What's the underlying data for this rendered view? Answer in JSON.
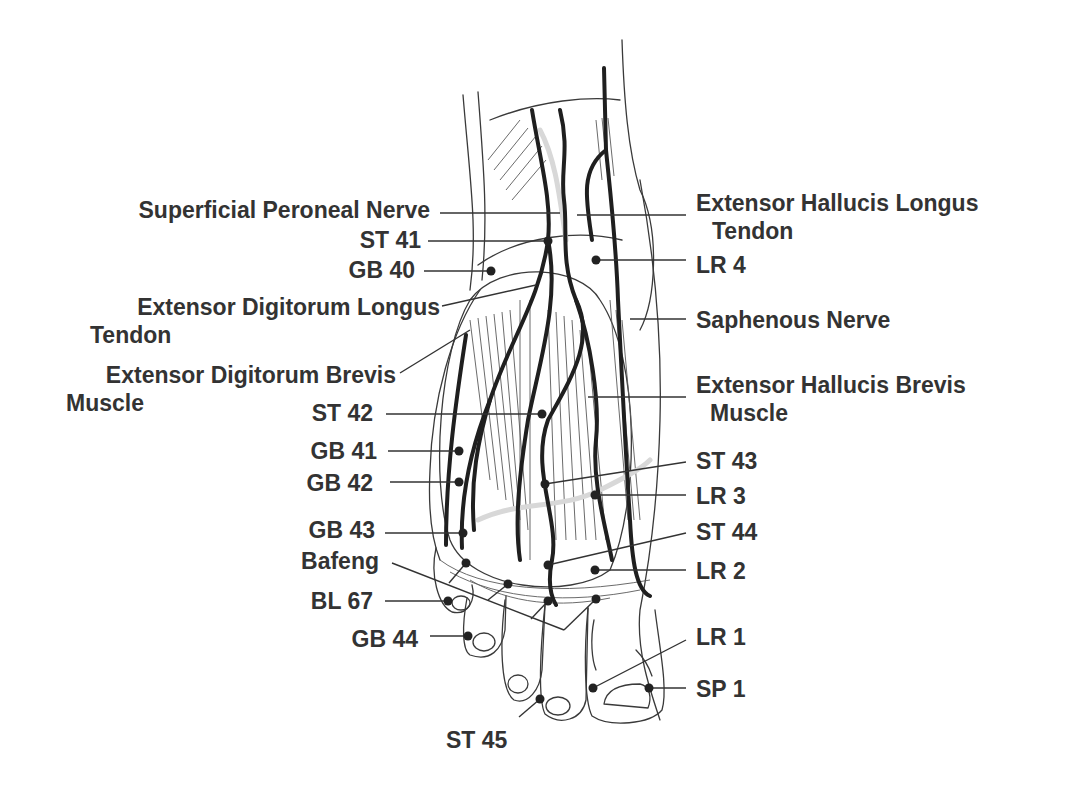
{
  "diagram": {
    "colors": {
      "text": "#333333",
      "line": "#333333",
      "nerve": "#1f1f1f",
      "background": "#ffffff"
    },
    "labels_left": [
      {
        "id": "superficial-peroneal-nerve",
        "lines": [
          "Superficial Peroneal Nerve"
        ],
        "x": 430,
        "y": 218,
        "anchor": "end",
        "leader": [
          440,
          213,
          560,
          213
        ],
        "point": null
      },
      {
        "id": "st-41",
        "lines": [
          "ST 41"
        ],
        "x": 421,
        "y": 248,
        "anchor": "end",
        "leader": [
          428,
          241,
          548,
          241
        ],
        "point": [
          548,
          241
        ]
      },
      {
        "id": "gb-40",
        "lines": [
          "GB 40"
        ],
        "x": 415,
        "y": 278,
        "anchor": "end",
        "leader": [
          424,
          271,
          491,
          271
        ],
        "point": [
          491,
          271
        ]
      },
      {
        "id": "extensor-digitorum-longus-tendon",
        "lines": [
          "Extensor Digitorum Longus",
          "Tendon"
        ],
        "x": 440,
        "y": 315,
        "anchor": "end",
        "line2_x": 90,
        "leader": [
          442,
          306,
          536,
          285
        ],
        "point": null
      },
      {
        "id": "extensor-digitorum-brevis-muscle",
        "lines": [
          "Extensor Digitorum Brevis",
          "Muscle"
        ],
        "x": 396,
        "y": 383,
        "anchor": "end",
        "line2_x": 66,
        "leader": [
          400,
          373,
          470,
          330
        ],
        "point": null
      },
      {
        "id": "st-42",
        "lines": [
          "ST 42"
        ],
        "x": 373,
        "y": 421,
        "anchor": "end",
        "leader": [
          386,
          414,
          542,
          414
        ],
        "point": [
          542,
          414
        ]
      },
      {
        "id": "gb-41",
        "lines": [
          "GB 41"
        ],
        "x": 377,
        "y": 459,
        "anchor": "end",
        "leader": [
          388,
          451,
          459,
          451
        ],
        "point": [
          459,
          451
        ]
      },
      {
        "id": "gb-42",
        "lines": [
          "GB 42"
        ],
        "x": 373,
        "y": 491,
        "anchor": "end",
        "leader": [
          390,
          482,
          459,
          482
        ],
        "point": [
          459,
          482
        ]
      },
      {
        "id": "gb-43",
        "lines": [
          "GB 43"
        ],
        "x": 375,
        "y": 538,
        "anchor": "end",
        "leader": [
          385,
          533,
          463,
          533
        ],
        "point": [
          463,
          533
        ]
      },
      {
        "id": "bafeng",
        "lines": [
          "Bafeng"
        ],
        "x": 379,
        "y": 569,
        "anchor": "end",
        "leader": [
          392,
          563,
          564,
          630
        ],
        "point": null
      },
      {
        "id": "bl-67",
        "lines": [
          "BL 67"
        ],
        "x": 373,
        "y": 609,
        "anchor": "end",
        "leader": [
          385,
          601,
          448,
          601
        ],
        "point": [
          448,
          601
        ]
      },
      {
        "id": "gb-44",
        "lines": [
          "GB 44"
        ],
        "x": 418,
        "y": 647,
        "anchor": "end",
        "leader": [
          430,
          636,
          468,
          636
        ],
        "point": [
          468,
          636
        ]
      },
      {
        "id": "st-45",
        "lines": [
          "ST 45"
        ],
        "x": 446,
        "y": 748,
        "anchor": "start",
        "leader": [
          519,
          717,
          540,
          699
        ],
        "point": [
          540,
          699
        ]
      }
    ],
    "labels_right": [
      {
        "id": "extensor-hallucis-longus-tendon",
        "lines": [
          "Extensor Hallucis Longus",
          "Tendon"
        ],
        "x": 696,
        "y": 211,
        "anchor": "start",
        "line2_x": 712,
        "leader": [
          577,
          215,
          686,
          215
        ],
        "point": null
      },
      {
        "id": "lr-4",
        "lines": [
          "LR 4"
        ],
        "x": 696,
        "y": 273,
        "anchor": "start",
        "leader": [
          596,
          260,
          686,
          260
        ],
        "point": [
          596,
          260
        ]
      },
      {
        "id": "saphenous-nerve",
        "lines": [
          "Saphenous Nerve"
        ],
        "x": 696,
        "y": 328,
        "anchor": "start",
        "leader": [
          630,
          319,
          686,
          319
        ],
        "point": null
      },
      {
        "id": "extensor-hallucis-brevis-muscle",
        "lines": [
          "Extensor Hallucis Brevis",
          "Muscle"
        ],
        "x": 696,
        "y": 393,
        "anchor": "start",
        "line2_x": 710,
        "leader": [
          588,
          397,
          686,
          397
        ],
        "point": null
      },
      {
        "id": "st-43",
        "lines": [
          "ST 43"
        ],
        "x": 696,
        "y": 469,
        "anchor": "start",
        "leader": [
          545,
          484,
          686,
          462
        ],
        "point": [
          545,
          484
        ]
      },
      {
        "id": "lr-3",
        "lines": [
          "LR 3"
        ],
        "x": 696,
        "y": 504,
        "anchor": "start",
        "leader": [
          595,
          495,
          686,
          495
        ],
        "point": [
          595,
          495
        ]
      },
      {
        "id": "st-44",
        "lines": [
          "ST 44"
        ],
        "x": 696,
        "y": 540,
        "anchor": "start",
        "leader": [
          548,
          565,
          686,
          533
        ],
        "point": [
          548,
          565
        ]
      },
      {
        "id": "lr-2",
        "lines": [
          "LR 2"
        ],
        "x": 696,
        "y": 579,
        "anchor": "start",
        "leader": [
          595,
          570,
          686,
          570
        ],
        "point": [
          595,
          570
        ]
      },
      {
        "id": "lr-1",
        "lines": [
          "LR 1"
        ],
        "x": 696,
        "y": 645,
        "anchor": "start",
        "leader": [
          593,
          688,
          686,
          640
        ],
        "point": [
          593,
          688
        ]
      },
      {
        "id": "sp-1",
        "lines": [
          "SP 1"
        ],
        "x": 696,
        "y": 697,
        "anchor": "start",
        "leader": [
          649,
          688,
          686,
          688
        ],
        "point": [
          649,
          688
        ]
      }
    ],
    "extra_points": [
      {
        "id": "bafeng-point-1",
        "point": [
          466,
          563
        ]
      },
      {
        "id": "bafeng-point-2",
        "point": [
          508,
          584
        ]
      },
      {
        "id": "bafeng-point-3",
        "point": [
          548,
          601
        ]
      },
      {
        "id": "bafeng-point-4",
        "point": [
          596,
          599
        ]
      }
    ],
    "bafeng_branches": [
      [
        449,
        583,
        466,
        563
      ],
      [
        488,
        600,
        508,
        584
      ],
      [
        531,
        619,
        548,
        601
      ],
      [
        564,
        630,
        596,
        599
      ]
    ]
  }
}
